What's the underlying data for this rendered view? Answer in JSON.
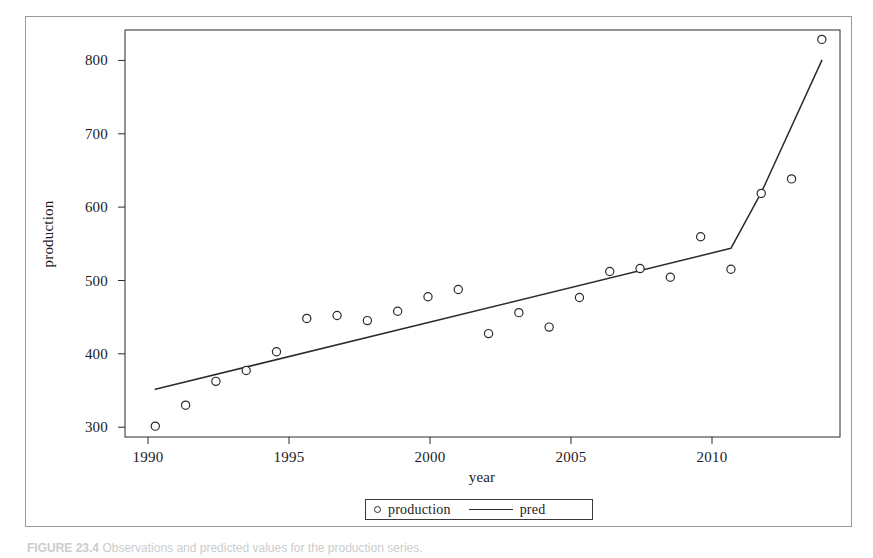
{
  "figure": {
    "caption_lead": "FIGURE 23.4",
    "caption_text": "Observations and predicted values for the production series."
  },
  "legend": {
    "items": [
      {
        "label": "production",
        "marker": "open-circle-marker"
      },
      {
        "label": "pred",
        "marker": "solid-line-marker"
      }
    ]
  },
  "axes": {
    "y_title": "production",
    "x_title": "year",
    "y_ticks": [
      "300",
      "400",
      "500",
      "600",
      "700",
      "800"
    ],
    "x_ticks": [
      "1990",
      "1995",
      "2000",
      "2005",
      "2010"
    ]
  },
  "chart_data": {
    "type": "scatter",
    "title": "",
    "xlabel": "year",
    "ylabel": "production",
    "xlim": [
      1990,
      2013.6
    ],
    "ylim": [
      287,
      850
    ],
    "grid": false,
    "legend_position": "bottom-center",
    "x_ticks": [
      1990,
      1995,
      2000,
      2005,
      2010
    ],
    "y_ticks": [
      300,
      400,
      500,
      600,
      700,
      800
    ],
    "x": [
      1991,
      1992,
      1993,
      1994,
      1995,
      1996,
      1997,
      1998,
      1999,
      2000,
      2001,
      2002,
      2003,
      2004,
      2005,
      2006,
      2007,
      2008,
      2009,
      2010,
      2011,
      2012,
      2013
    ],
    "series": [
      {
        "name": "production",
        "style": "open-circle-markers",
        "values": [
          302,
          331,
          364,
          379,
          405,
          451,
          455,
          448,
          461,
          481,
          491,
          430,
          459,
          439,
          480,
          516,
          520,
          508,
          564,
          519,
          624,
          644,
          837
        ]
      },
      {
        "name": "pred",
        "style": "solid-line",
        "x": [
          1991,
          2010,
          2011,
          2013
        ],
        "values": [
          353,
          548,
          625,
          808
        ]
      }
    ]
  }
}
